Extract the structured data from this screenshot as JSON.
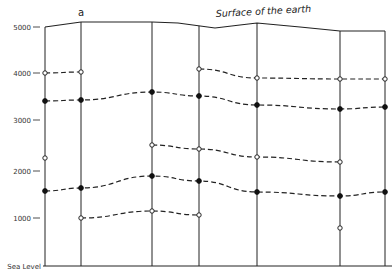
{
  "diagram": {
    "title": "Surface of the earth",
    "column_label": "a",
    "y_axis": {
      "ticks": [
        {
          "label": "5000",
          "y": 27
        },
        {
          "label": "4000",
          "y": 73
        },
        {
          "label": "3000",
          "y": 120
        },
        {
          "label": "2000",
          "y": 171
        },
        {
          "label": "1000",
          "y": 218
        },
        {
          "label": "Sea Level",
          "y": 266
        }
      ]
    },
    "verticals": [
      45,
      81,
      152,
      199,
      257,
      340,
      385
    ],
    "surface": [
      [
        45,
        27
      ],
      [
        81,
        22
      ],
      [
        152,
        22
      ],
      [
        178,
        23
      ],
      [
        215,
        28
      ],
      [
        240,
        25
      ],
      [
        257,
        23
      ],
      [
        300,
        27
      ],
      [
        340,
        31
      ],
      [
        385,
        31
      ]
    ],
    "lines": [
      {
        "name": "open-upper-left",
        "marker": "open",
        "points": [
          [
            45,
            73
          ],
          [
            81,
            72
          ]
        ]
      },
      {
        "name": "open-upper-right",
        "marker": "open",
        "points": [
          [
            199,
            69
          ],
          [
            257,
            78
          ],
          [
            340,
            79
          ],
          [
            385,
            79
          ]
        ]
      },
      {
        "name": "filled-upper",
        "marker": "filled",
        "points": [
          [
            45,
            101
          ],
          [
            81,
            100
          ],
          [
            152,
            92
          ],
          [
            199,
            96
          ],
          [
            257,
            105
          ],
          [
            340,
            109
          ],
          [
            385,
            107
          ]
        ]
      },
      {
        "name": "open-middle",
        "marker": "open",
        "points": [
          [
            152,
            145
          ],
          [
            199,
            149
          ],
          [
            257,
            157
          ],
          [
            340,
            162
          ]
        ]
      },
      {
        "name": "filled-lower",
        "marker": "filled",
        "points": [
          [
            45,
            191
          ],
          [
            81,
            188
          ],
          [
            152,
            176
          ],
          [
            199,
            181
          ],
          [
            257,
            192
          ],
          [
            340,
            196
          ],
          [
            385,
            192
          ]
        ]
      },
      {
        "name": "open-lower",
        "marker": "open",
        "points": [
          [
            81,
            218
          ],
          [
            152,
            211
          ],
          [
            199,
            215
          ]
        ]
      }
    ],
    "isolated_points": [
      {
        "marker": "open",
        "x": 45,
        "y": 158
      },
      {
        "marker": "open",
        "x": 340,
        "y": 228
      }
    ],
    "colors": {
      "ink": "#222222",
      "background": "#ffffff"
    }
  }
}
